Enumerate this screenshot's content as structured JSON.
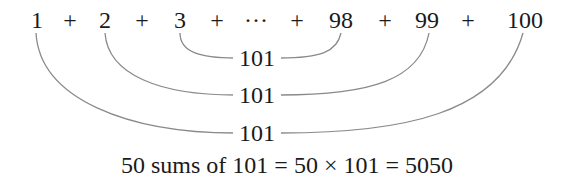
{
  "diagram": {
    "sequence": [
      {
        "text": "1",
        "x": 37
      },
      {
        "text": "+",
        "x": 70
      },
      {
        "text": "2",
        "x": 105
      },
      {
        "text": "+",
        "x": 142
      },
      {
        "text": "3",
        "x": 180
      },
      {
        "text": "+",
        "x": 217
      },
      {
        "text": "···",
        "x": 256
      },
      {
        "text": "+",
        "x": 297
      },
      {
        "text": "98",
        "x": 341
      },
      {
        "text": "+",
        "x": 385
      },
      {
        "text": "99",
        "x": 427
      },
      {
        "text": "+",
        "x": 468
      },
      {
        "text": "100",
        "x": 525
      }
    ],
    "pair_labels": [
      "101",
      "101",
      "101"
    ],
    "pairs": [
      {
        "left": "3",
        "right": "98",
        "sum": "101"
      },
      {
        "left": "2",
        "right": "99",
        "sum": "101"
      },
      {
        "left": "1",
        "right": "100",
        "sum": "101"
      }
    ],
    "conclusion": "50 sums of 101 = 50 × 101 = 5050",
    "curve_color": "#8a8a8a"
  }
}
